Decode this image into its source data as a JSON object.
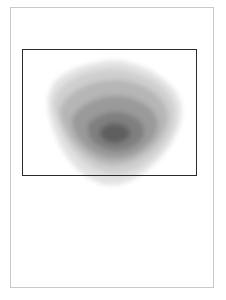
{
  "figure": {
    "title": "",
    "background_color": "#ffffff",
    "frame": {
      "label": "figure-border",
      "color": "#c9c9c9",
      "x": 10,
      "y": 7,
      "width": 204,
      "height": 281
    }
  },
  "roi": {
    "label": "region-of-interest-box",
    "color": "#2b2b2b",
    "x": 22,
    "y": 49,
    "width": 175,
    "height": 127
  },
  "chart_data": {
    "type": "heatmap",
    "subtype": "filled-contour-density",
    "title": "",
    "subtitle": "",
    "xlabel": "",
    "ylabel": "",
    "grid": false,
    "legend": "none",
    "colormap": "greys",
    "axis_ticks": [],
    "xlim": [
      0,
      226
    ],
    "ylim": [
      0,
      300
    ],
    "peak": {
      "x": 115,
      "y": 131,
      "level": 6
    },
    "levels": [
      {
        "level": 1,
        "value": 0.08,
        "color": "#efefef",
        "opacity": 1.0
      },
      {
        "level": 2,
        "value": 0.22,
        "color": "#e2e2e2",
        "opacity": 1.0
      },
      {
        "level": 3,
        "value": 0.38,
        "color": "#cfcfcf",
        "opacity": 1.0
      },
      {
        "level": 4,
        "value": 0.55,
        "color": "#b6b6b6",
        "opacity": 1.0
      },
      {
        "level": 5,
        "value": 0.72,
        "color": "#9a9a9a",
        "opacity": 1.0
      },
      {
        "level": 6,
        "value": 0.88,
        "color": "#7f7f7f",
        "opacity": 1.0
      },
      {
        "level": 7,
        "value": 1.0,
        "color": "#5f5f5f",
        "opacity": 1.0
      }
    ],
    "contours": [
      {
        "level": 1,
        "color": "#efefef",
        "points": "44,92 48,78 58,70 72,64 88,60 104,56 118,55 134,58 150,64 164,72 178,82 188,94 192,108 191,124 186,140 178,154 168,166 156,178 142,188 126,194 110,196 94,193 80,186 68,176 58,164 50,150 44,134 41,116"
      },
      {
        "level": 2,
        "color": "#e2e2e2",
        "points": "48,98 53,84 63,75 77,68 92,64 107,61 121,61 136,65 151,71 164,80 175,91 181,104 181,119 176,134 168,148 158,160 146,171 132,180 117,185 102,184 89,178 77,169 67,157 59,143 53,128 49,113"
      },
      {
        "level": 3,
        "color": "#cfcfcf",
        "points": "53,104 58,91 68,82 81,75 95,71 110,69 124,70 138,74 152,80 164,89 172,100 175,113 173,127 167,140 158,152 147,162 134,170 120,174 106,173 93,168 82,160 72,149 64,136 58,122 55,112"
      },
      {
        "level": 4,
        "color": "#b6b6b6",
        "points": "60,110 66,99 77,90 90,84 104,81 118,80 132,82 145,87 156,94 164,104 168,115 166,127 160,139 151,149 140,157 127,163 113,165 100,163 89,157 79,149 70,138 64,126 61,118"
      },
      {
        "level": 5,
        "color": "#9a9a9a",
        "points": "72,118 80,108 92,101 105,97 118,96 131,98 143,103 152,110 157,119 157,130 152,140 144,148 133,155 121,158 108,158 96,154 86,147 78,138 73,128"
      },
      {
        "level": 6,
        "color": "#7f7f7f",
        "points": "88,124 97,117 108,113 119,112 130,115 139,120 144,128 143,137 137,144 127,149 116,151 105,149 95,144 89,136"
      },
      {
        "level": 7,
        "color": "#5f5f5f",
        "points": "102,128 110,124 119,124 126,127 130,132 128,138 121,142 112,143 104,140 100,134"
      }
    ]
  }
}
